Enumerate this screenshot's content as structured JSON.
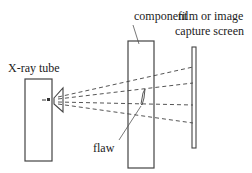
{
  "diagram": {
    "labels": {
      "xray_tube": "X-ray tube",
      "component": "component",
      "screen_line1": "film or image",
      "screen_line2": "capture screen",
      "flaw": "flaw"
    },
    "colors": {
      "stroke": "#444444",
      "text": "#222222",
      "background": "#ffffff"
    },
    "rays": {
      "count": 4,
      "style": "dashed"
    }
  }
}
